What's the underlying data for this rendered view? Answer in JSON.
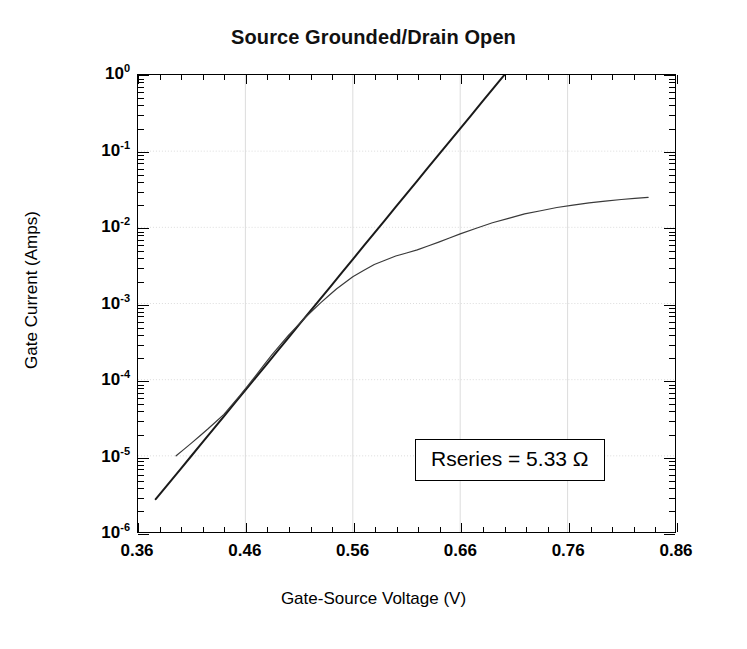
{
  "chart_data": {
    "type": "line",
    "title": "Source Grounded/Drain Open",
    "xlabel": "Gate-Source Voltage (V)",
    "ylabel": "Gate Current (Amps)",
    "xlim": [
      0.36,
      0.86
    ],
    "ylim": [
      1e-06,
      1
    ],
    "yscale": "log",
    "xscale": "linear",
    "grid": true,
    "legend": "none",
    "xticks": [
      "0.36",
      "0.46",
      "0.56",
      "0.66",
      "0.76",
      "0.86"
    ],
    "xtick_values": [
      0.36,
      0.46,
      0.56,
      0.66,
      0.76,
      0.86
    ],
    "yticks": [
      "10^0",
      "10^-1",
      "10^-2",
      "10^-3",
      "10^-4",
      "10^-5",
      "10^-6"
    ],
    "ytick_mantissas": [
      "10",
      "10",
      "10",
      "10",
      "10",
      "10",
      "10"
    ],
    "ytick_exponents": [
      "0",
      "-1",
      "-2",
      "-3",
      "-4",
      "-5",
      "-6"
    ],
    "ytick_values": [
      1,
      0.1,
      0.01,
      0.001,
      0.0001,
      1e-05,
      1e-06
    ],
    "annotations": [
      {
        "text": "Rseries  =  5.33 Ω",
        "x": 0.695,
        "y": 2e-05
      }
    ],
    "series": [
      {
        "name": "ideal-diode-fit",
        "style": "solid",
        "color": "#1a1a1a",
        "width": 2.0,
        "points": [
          [
            0.3765,
            2.7e-06
          ],
          [
            0.4,
            6.8e-06
          ],
          [
            0.42,
            1.5e-05
          ],
          [
            0.44,
            3.3e-05
          ],
          [
            0.46,
            7.3e-05
          ],
          [
            0.48,
            0.00016
          ],
          [
            0.5,
            0.000355
          ],
          [
            0.52,
            0.00078
          ],
          [
            0.54,
            0.00172
          ],
          [
            0.56,
            0.0038
          ],
          [
            0.58,
            0.0084
          ],
          [
            0.6,
            0.0185
          ],
          [
            0.62,
            0.0408
          ],
          [
            0.64,
            0.09
          ],
          [
            0.66,
            0.198
          ],
          [
            0.68,
            0.436
          ],
          [
            0.7,
            0.96
          ],
          [
            0.718,
            1.85
          ]
        ]
      },
      {
        "name": "measured-gate-current",
        "style": "solid",
        "color": "#3a3a3a",
        "width": 1.2,
        "points": [
          [
            0.3955,
            1e-05
          ],
          [
            0.41,
            1.48e-05
          ],
          [
            0.425,
            2.25e-05
          ],
          [
            0.44,
            3.5e-05
          ],
          [
            0.455,
            6.2e-05
          ],
          [
            0.47,
            0.000115
          ],
          [
            0.485,
            0.000215
          ],
          [
            0.5,
            0.00038
          ],
          [
            0.515,
            0.00064
          ],
          [
            0.53,
            0.00102
          ],
          [
            0.545,
            0.00156
          ],
          [
            0.56,
            0.00225
          ],
          [
            0.58,
            0.00325
          ],
          [
            0.6,
            0.0042
          ],
          [
            0.62,
            0.00505
          ],
          [
            0.64,
            0.0064
          ],
          [
            0.66,
            0.0082
          ],
          [
            0.69,
            0.0115
          ],
          [
            0.72,
            0.015
          ],
          [
            0.75,
            0.0182
          ],
          [
            0.78,
            0.021
          ],
          [
            0.81,
            0.0232
          ],
          [
            0.835,
            0.0248
          ]
        ]
      }
    ]
  },
  "figure": {
    "title": "Source Grounded/Drain Open",
    "annotation_label": "Rseries  =  5.33 Ω",
    "x_axis_title": "Gate-Source Voltage (V)",
    "y_axis_title": "Gate Current (Amps)"
  }
}
